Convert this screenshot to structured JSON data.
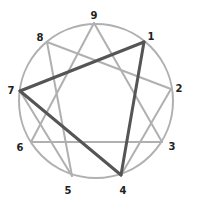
{
  "diagram": {
    "type": "enneagram",
    "circle": {
      "cx": 96,
      "cy": 101,
      "r": 77,
      "color": "#b0b0b0"
    },
    "colors": {
      "light_line": "#b0b0b0",
      "dark_line": "#555555",
      "label": "#222222"
    },
    "points": [
      {
        "id": "9",
        "label": "9",
        "x": 94,
        "y": 23,
        "lx": 94,
        "ly": 16
      },
      {
        "id": "1",
        "label": "1",
        "x": 144,
        "y": 42,
        "lx": 151,
        "ly": 37
      },
      {
        "id": "2",
        "label": "2",
        "x": 171,
        "y": 89,
        "lx": 179,
        "ly": 89
      },
      {
        "id": "3",
        "label": "3",
        "x": 162,
        "y": 142,
        "lx": 172,
        "ly": 147
      },
      {
        "id": "4",
        "label": "4",
        "x": 121,
        "y": 175,
        "lx": 123,
        "ly": 191
      },
      {
        "id": "5",
        "label": "5",
        "x": 72,
        "y": 176,
        "lx": 68,
        "ly": 191
      },
      {
        "id": "6",
        "label": "6",
        "x": 31,
        "y": 142,
        "lx": 20,
        "ly": 148
      },
      {
        "id": "7",
        "label": "7",
        "x": 20,
        "y": 91,
        "lx": 11,
        "ly": 91
      },
      {
        "id": "8",
        "label": "8",
        "x": 47,
        "y": 42,
        "lx": 40,
        "ly": 38
      }
    ],
    "light_edges": [
      [
        "9",
        "3"
      ],
      [
        "3",
        "6"
      ],
      [
        "6",
        "9"
      ],
      [
        "4",
        "2"
      ],
      [
        "2",
        "8"
      ],
      [
        "8",
        "5"
      ],
      [
        "5",
        "7"
      ]
    ],
    "dark_edges": [
      [
        "7",
        "1"
      ],
      [
        "1",
        "4"
      ],
      [
        "4",
        "7"
      ]
    ]
  }
}
